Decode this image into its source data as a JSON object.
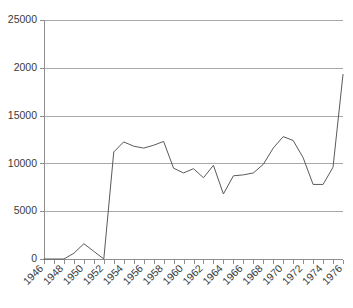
{
  "chart_data": {
    "type": "line",
    "title": "",
    "subtitle": "",
    "xlabel": "",
    "ylabel": "",
    "legend": [],
    "legend_position": "none",
    "grid": "horizontal",
    "xlim": [
      1946,
      1976
    ],
    "ylim": [
      0,
      25000
    ],
    "y_ticks": [
      0,
      5000,
      10000,
      15000,
      20000,
      25000
    ],
    "y_tick_labels": [
      "0",
      "5000",
      "10000",
      "15000",
      "2000",
      "25000"
    ],
    "x_ticks": [
      1946,
      1947,
      1948,
      1949,
      1950,
      1951,
      1952,
      1953,
      1954,
      1955,
      1956,
      1957,
      1958,
      1959,
      1960,
      1961,
      1962,
      1963,
      1964,
      1965,
      1966,
      1967,
      1968,
      1969,
      1970,
      1971,
      1972,
      1973,
      1974,
      1975,
      1976
    ],
    "x_tick_labels": [
      "1946",
      "1948",
      "1950",
      "1952",
      "1954",
      "1956",
      "1958",
      "1960",
      "1962",
      "1964",
      "1966",
      "1968",
      "1970",
      "1972",
      "1974",
      "1976"
    ],
    "x_tick_label_years": [
      1946,
      1948,
      1950,
      1952,
      1954,
      1956,
      1958,
      1960,
      1962,
      1964,
      1966,
      1968,
      1970,
      1972,
      1974,
      1976
    ],
    "x_tick_label_rotation": -45,
    "x": [
      1946,
      1947,
      1948,
      1949,
      1950,
      1951,
      1952,
      1953,
      1954,
      1955,
      1956,
      1957,
      1958,
      1959,
      1960,
      1961,
      1962,
      1963,
      1964,
      1965,
      1966,
      1967,
      1968,
      1969,
      1970,
      1971,
      1972,
      1973,
      1974,
      1975,
      1976
    ],
    "values": [
      0,
      0,
      0,
      600,
      1600,
      800,
      0,
      11200,
      12250,
      11800,
      11600,
      11900,
      12300,
      9500,
      9000,
      9450,
      8500,
      9800,
      6800,
      8700,
      8800,
      9000,
      9900,
      11600,
      12800,
      12400,
      10600,
      7800,
      7800,
      9600,
      19300
    ],
    "series_name": "",
    "line_color": "#5a5a5a",
    "gridline_color": "#a8a8a8",
    "axis_color": "#8f8f8f",
    "background_color": "#ffffff",
    "markers": false
  },
  "layout": {
    "plot_left": 44,
    "plot_right": 343,
    "plot_top": 20,
    "plot_bottom": 259
  }
}
